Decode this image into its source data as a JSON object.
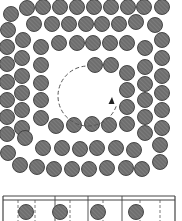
{
  "figure": {
    "colors": {
      "background": "#ffffff",
      "particle_fill": "#6e6e6e",
      "particle_stroke": "#3a3a3a",
      "hatch": "#9a9a9a",
      "line": "#444444",
      "dashed": "#555555"
    },
    "particle_radius": 7.5,
    "vortex": {
      "center": [
        88,
        96
      ],
      "radius": 30,
      "direction": "counter-clockwise",
      "arrow_tip": [
        112,
        101
      ]
    },
    "particles": [
      [
        27,
        8
      ],
      [
        43,
        7
      ],
      [
        60,
        7
      ],
      [
        77,
        7
      ],
      [
        94,
        7
      ],
      [
        111,
        7
      ],
      [
        128,
        7
      ],
      [
        144,
        7
      ],
      [
        162,
        7
      ],
      [
        11,
        14
      ],
      [
        34,
        24
      ],
      [
        52,
        24
      ],
      [
        69,
        24
      ],
      [
        86,
        24
      ],
      [
        102,
        24
      ],
      [
        119,
        24
      ],
      [
        136,
        22
      ],
      [
        155,
        25
      ],
      [
        8,
        30
      ],
      [
        23,
        40
      ],
      [
        59,
        43
      ],
      [
        77,
        43
      ],
      [
        93,
        43
      ],
      [
        110,
        43
      ],
      [
        127,
        43
      ],
      [
        162,
        40
      ],
      [
        7,
        47
      ],
      [
        41,
        47
      ],
      [
        145,
        48
      ],
      [
        22,
        58
      ],
      [
        162,
        58
      ],
      [
        7,
        64
      ],
      [
        41,
        65
      ],
      [
        95,
        65
      ],
      [
        111,
        65
      ],
      [
        145,
        67
      ],
      [
        22,
        76
      ],
      [
        162,
        76
      ],
      [
        7,
        82
      ],
      [
        41,
        83
      ],
      [
        127,
        73
      ],
      [
        145,
        84
      ],
      [
        22,
        93
      ],
      [
        162,
        93
      ],
      [
        7,
        100
      ],
      [
        41,
        100
      ],
      [
        127,
        90
      ],
      [
        145,
        100
      ],
      [
        22,
        110
      ],
      [
        162,
        110
      ],
      [
        7,
        117
      ],
      [
        41,
        118
      ],
      [
        127,
        107
      ],
      [
        145,
        117
      ],
      [
        22,
        128
      ],
      [
        56,
        126
      ],
      [
        74,
        125
      ],
      [
        92,
        124
      ],
      [
        109,
        125
      ],
      [
        127,
        124
      ],
      [
        162,
        128
      ],
      [
        7,
        134
      ],
      [
        145,
        133
      ],
      [
        25,
        138
      ],
      [
        43,
        148
      ],
      [
        62,
        148
      ],
      [
        80,
        149
      ],
      [
        97,
        148
      ],
      [
        116,
        148
      ],
      [
        134,
        150
      ],
      [
        160,
        145
      ],
      [
        8,
        153
      ],
      [
        20,
        165
      ],
      [
        37,
        167
      ],
      [
        54,
        169
      ],
      [
        72,
        169
      ],
      [
        89,
        169
      ],
      [
        107,
        168
      ],
      [
        126,
        168
      ],
      [
        142,
        169
      ],
      [
        160,
        162
      ]
    ],
    "strip": {
      "x": 3,
      "y": 196,
      "width": 172,
      "height": 28,
      "top_double_line_gap": 4,
      "solid_dividers": [
        55,
        88,
        122
      ],
      "dashed_dividers": [
        18,
        35,
        70,
        103,
        140,
        160
      ],
      "particles": [
        [
          26,
          212
        ],
        [
          60,
          212
        ],
        [
          98,
          212
        ],
        [
          136,
          212
        ]
      ]
    }
  }
}
